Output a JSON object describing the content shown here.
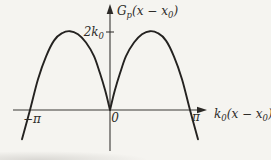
{
  "labels": {
    "y_axis": {
      "base": "G",
      "base_sub": "p",
      "arg_open": "(x − x",
      "arg_sub": "0",
      "arg_close": ")"
    },
    "x_axis": {
      "base": "k",
      "base_sub": "0",
      "arg_open": "(x − x",
      "arg_sub": "0",
      "arg_close": ")"
    },
    "y_tick_2k0": {
      "base": "2k",
      "sub": "0"
    },
    "x_ticks": {
      "neg_pi": "−π",
      "zero": "0",
      "pos_pi": "π"
    }
  },
  "chart_data": {
    "type": "line",
    "title": "",
    "xlabel": "k0(x − x0)",
    "ylabel": "Gp(x − x0)",
    "x_unit": "pi",
    "y_unit": "k0",
    "xlim_pi": [
      -1.2,
      1.2
    ],
    "ylim_k0": [
      -0.9,
      2.6
    ],
    "grid": false,
    "legend": false,
    "x_ticks": [
      {
        "value_pi": -1,
        "label": "−π"
      },
      {
        "value_pi": 0,
        "label": "0"
      },
      {
        "value_pi": 1,
        "label": "π"
      }
    ],
    "y_ticks": [
      {
        "value_k0": 2,
        "label": "2k0"
      }
    ],
    "curve_description": "G = 2 k0 sin(|k0(x−x0)|): cusp at origin, peaks of 2k0 at ±π/2, zeros at 0 and ±π, negative beyond ±π",
    "points_pi_k0": [
      [
        -1.1,
        -0.75
      ],
      [
        -1.0,
        0.0
      ],
      [
        -0.9,
        0.79
      ],
      [
        -0.8,
        1.37
      ],
      [
        -0.7,
        1.78
      ],
      [
        -0.6,
        1.97
      ],
      [
        -0.5,
        2.02
      ],
      [
        -0.4,
        1.94
      ],
      [
        -0.3,
        1.73
      ],
      [
        -0.2,
        1.38
      ],
      [
        -0.125,
        0.94
      ],
      [
        -0.06,
        0.5
      ],
      [
        0.0,
        0.0
      ],
      [
        0.06,
        0.5
      ],
      [
        0.125,
        0.94
      ],
      [
        0.2,
        1.38
      ],
      [
        0.3,
        1.73
      ],
      [
        0.4,
        1.94
      ],
      [
        0.5,
        2.02
      ],
      [
        0.6,
        1.97
      ],
      [
        0.7,
        1.78
      ],
      [
        0.8,
        1.37
      ],
      [
        0.9,
        0.79
      ],
      [
        1.0,
        0.0
      ],
      [
        1.1,
        -0.75
      ]
    ]
  }
}
